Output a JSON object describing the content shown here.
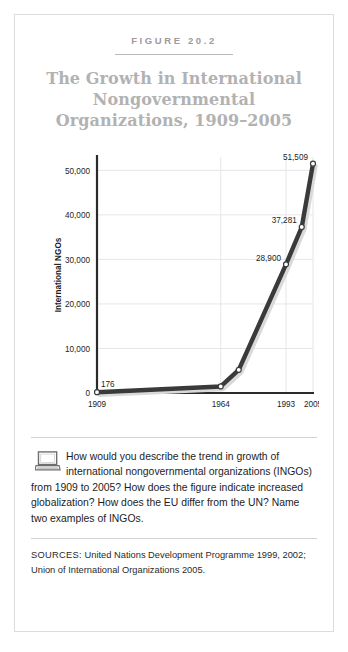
{
  "figure": {
    "number_label": "FIGURE 20.2",
    "title_line1": "The Growth in International",
    "title_line2": "Nongovernmental",
    "title_line3": "Organizations, 1909–2005"
  },
  "question": {
    "icon": "laptop-icon",
    "text": "How would you describe the trend in growth of international nongovernmental organizations (INGOs) from 1909 to 2005? How does the figure indicate increased globalization? How does the EU differ from the UN? Name two examples of INGOs."
  },
  "sources": {
    "label": "SOURCES:",
    "text": "United Nations Development Programme 1999, 2002; Union of International Organizations 2005."
  },
  "colors": {
    "line": "#3a3a3a",
    "marker_fill": "#ffffff",
    "marker_stroke": "#3a3a3a",
    "gridline": "#e6e6e6",
    "axis": "#2b2b2b",
    "title_text": "#b2b2b2",
    "figure_label_text": "#9b9b9b",
    "frame_border": "#dcdcdc",
    "shadow": "#d9d9d9"
  },
  "chart_data": {
    "type": "line",
    "title": "The Growth in International Nongovernmental Organizations, 1909–2005",
    "xlabel": "",
    "ylabel": "International NGOs",
    "x": [
      1909,
      1964,
      1972,
      1993,
      2000,
      2005
    ],
    "values": [
      176,
      1470,
      5200,
      28900,
      37281,
      51509
    ],
    "series": [
      {
        "name": "International NGOs",
        "x": [
          1909,
          1964,
          1972,
          1993,
          2000,
          2005
        ],
        "values": [
          176,
          1470,
          5200,
          28900,
          37281,
          51509
        ]
      }
    ],
    "point_labels": [
      {
        "x": 1909,
        "value": 176,
        "label": "176"
      },
      {
        "x": 1964,
        "value": 1470,
        "label": ""
      },
      {
        "x": 1972,
        "value": 5200,
        "label": ""
      },
      {
        "x": 1993,
        "value": 28900,
        "label": "28,900"
      },
      {
        "x": 2000,
        "value": 37281,
        "label": "37,281"
      },
      {
        "x": 2005,
        "value": 51509,
        "label": "51,509"
      }
    ],
    "xticks": [
      1909,
      1964,
      1993,
      2005
    ],
    "xticklabels": [
      "1909",
      "1964",
      "1993",
      "2005"
    ],
    "yticks": [
      0,
      10000,
      20000,
      30000,
      40000,
      50000
    ],
    "yticklabels": [
      "0",
      "10,000",
      "20,000",
      "30,000",
      "40,000",
      "50,000"
    ],
    "ylim": [
      0,
      53000
    ],
    "xlim": [
      1909,
      2005
    ],
    "grid": true,
    "grid_axis": "both",
    "legend": false,
    "markers": "circle"
  }
}
